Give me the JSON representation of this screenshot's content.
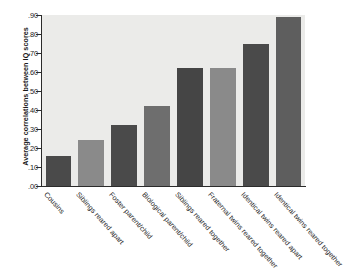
{
  "chart_data": {
    "type": "bar",
    "title": "",
    "xlabel": "",
    "ylabel": "Average correlations between IQ scores",
    "ylim": [
      0.0,
      0.9
    ],
    "grid": false,
    "legend": null,
    "categories": [
      "Cousins",
      "Siblings reared apart",
      "Foster parent/child",
      "Biological parent/child",
      "Siblings reared together",
      "Fraternal twins reared together",
      "Identical twins reared apart",
      "Identical twins reared together"
    ],
    "values": [
      0.16,
      0.24,
      0.32,
      0.42,
      0.62,
      0.62,
      0.75,
      0.89
    ],
    "ytick_labels": [
      ".90",
      ".80",
      ".70",
      ".60",
      ".50",
      ".40",
      ".30",
      ".20",
      ".10",
      ".00"
    ],
    "ytick_values": [
      0.9,
      0.8,
      0.7,
      0.6,
      0.5,
      0.4,
      0.3,
      0.2,
      0.1,
      0.0
    ],
    "bar_colors": [
      "#4a4a4a",
      "#8a8a8a",
      "#4a4a4a",
      "#6e6e6e",
      "#454545",
      "#8a8a8a",
      "#4a4a4a",
      "#5e5e5e"
    ],
    "plot_background": "#ebebe9",
    "axis_color": "#2b2b2b",
    "figure_background": "#ffffff"
  }
}
